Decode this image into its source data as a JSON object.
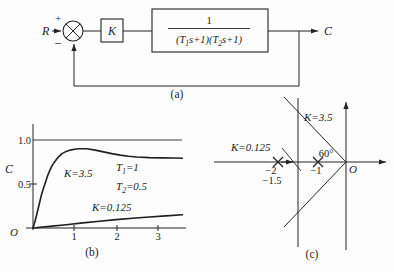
{
  "captions": {
    "a": "(a)",
    "b": "(b)",
    "c": "(c)"
  },
  "block_diagram": {
    "input_label": "R",
    "plus_sign": "+",
    "minus_sign": "−",
    "gain_label": "K",
    "tf_numerator": "1",
    "tf_denominator_parts": [
      "(T",
      "1",
      "s+1)(T",
      "2",
      "s+1)"
    ],
    "output_label": "C"
  },
  "step_plot": {
    "ylabel": "C",
    "origin_label": "O",
    "ytick_top": "1.0",
    "ytick_mid": "0.5",
    "xtick_1": "1",
    "xtick_2": "2",
    "xtick_3": "3",
    "label_high_gain": "K=3.5",
    "label_low_gain": "K=0.125",
    "param_t1_parts": [
      "T",
      "1",
      "=1"
    ],
    "param_t2_parts": [
      "T",
      "2",
      "=0.5"
    ]
  },
  "root_locus": {
    "label_high_gain": "K=3.5",
    "label_low_gain": "K=0.125",
    "angle_label": "60°",
    "origin_label": "O",
    "pole_minus2_label": "−2",
    "breakaway_label": "−1.5",
    "pole_minus1_label": "−1"
  },
  "chart_data": [
    {
      "id": "step-response",
      "type": "line",
      "ylabel": "C",
      "xticks": [
        1,
        2,
        3
      ],
      "yticks": [
        0.5,
        1.0
      ],
      "xlim": [
        0,
        3.6
      ],
      "ylim": [
        0,
        1.15
      ],
      "reference_line_y": 1.0,
      "grid": false,
      "annotations": [
        "K=3.5",
        "K=0.125",
        "T1=1",
        "T2=0.5"
      ],
      "series": [
        {
          "name": "K=3.5",
          "x": [
            0,
            0.05,
            0.1,
            0.15,
            0.2,
            0.25,
            0.3,
            0.35,
            0.4,
            0.45,
            0.5,
            0.6,
            0.7,
            0.8,
            0.9,
            1.0,
            1.1,
            1.3,
            1.5,
            1.7,
            1.9,
            2.1,
            2.3,
            2.5,
            2.8,
            3.1,
            3.4,
            3.6
          ],
          "y": [
            0,
            0.08,
            0.17,
            0.27,
            0.37,
            0.45,
            0.52,
            0.59,
            0.65,
            0.7,
            0.74,
            0.8,
            0.845,
            0.87,
            0.885,
            0.895,
            0.9,
            0.9,
            0.885,
            0.865,
            0.845,
            0.828,
            0.815,
            0.807,
            0.8,
            0.797,
            0.795,
            0.793
          ]
        },
        {
          "name": "K=0.125",
          "x": [
            0,
            0.4,
            0.8,
            1.2,
            1.6,
            2.0,
            2.4,
            2.8,
            3.2,
            3.6
          ],
          "y": [
            0,
            0.018,
            0.038,
            0.058,
            0.077,
            0.095,
            0.111,
            0.125,
            0.138,
            0.15
          ]
        }
      ]
    },
    {
      "id": "root-locus",
      "type": "scatter",
      "open_loop_poles": [
        -2,
        -1
      ],
      "breakaway_point": -1.5,
      "breakaway_gain_label": "K=0.125",
      "vertical_branch_real_part": -1.5,
      "damping_angle_deg": 60,
      "angle_gain_label": "K=3.5",
      "real_axis_tick_labels": [
        "-2",
        "-1.5",
        "-1"
      ],
      "origin_label": "O"
    }
  ]
}
